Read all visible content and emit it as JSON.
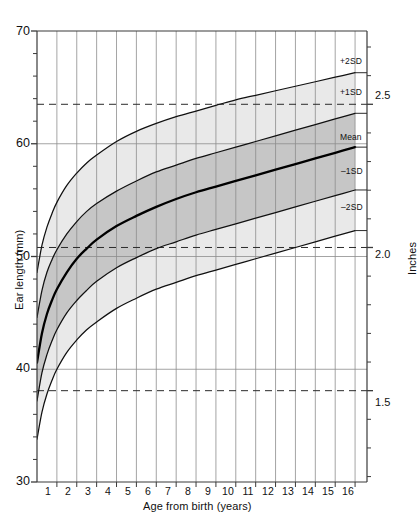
{
  "chart_data": {
    "type": "line",
    "title": "",
    "xlabel": "Age from birth (years)",
    "ylabel": "Ear length (mm)",
    "y2label": "Inches",
    "xlim": [
      0,
      16.6
    ],
    "ylim": [
      30,
      70
    ],
    "grid": true,
    "legend_position": "right-inline",
    "x_ticks": [
      "1",
      "2",
      "3",
      "4",
      "5",
      "6",
      "7",
      "8",
      "9",
      "10",
      "11",
      "12",
      "13",
      "14",
      "15",
      "16"
    ],
    "x_tick_values": [
      1,
      2,
      3,
      4,
      5,
      6,
      7,
      8,
      9,
      10,
      11,
      12,
      13,
      14,
      15,
      16
    ],
    "y_ticks": [
      "70",
      "60",
      "50",
      "40",
      "30"
    ],
    "y_tick_values": [
      70,
      60,
      50,
      40,
      30
    ],
    "y_minor_step_mm": 2,
    "y2_ticks": [
      "2.5",
      "2.0",
      "1.5"
    ],
    "y2_tick_values_mm": [
      63.5,
      50.8,
      38.1
    ],
    "reference_lines": [
      {
        "label": "2.5",
        "value_mm": 63.5,
        "style": "dashed"
      },
      {
        "label": "2.0",
        "value_mm": 50.8,
        "style": "dashed"
      },
      {
        "label": "1.5",
        "value_mm": 38.1,
        "style": "dashed"
      }
    ],
    "x": [
      0,
      0.25,
      0.5,
      0.75,
      1,
      1.5,
      2,
      2.5,
      3,
      4,
      5,
      6,
      7,
      8,
      9,
      10,
      11,
      12,
      13,
      14,
      15,
      16
    ],
    "series": [
      {
        "name": "+2SD",
        "label": "+2SD",
        "values": [
          48.6,
          51.0,
          52.6,
          53.8,
          54.8,
          56.3,
          57.4,
          58.3,
          59.0,
          60.2,
          61.1,
          61.8,
          62.4,
          62.9,
          63.4,
          63.9,
          64.3,
          64.7,
          65.1,
          65.5,
          65.9,
          66.3
        ]
      },
      {
        "name": "+1SD",
        "label": "+1SD",
        "values": [
          44.6,
          47.0,
          48.6,
          49.7,
          50.6,
          52.0,
          53.1,
          54.0,
          54.7,
          55.8,
          56.7,
          57.5,
          58.1,
          58.7,
          59.2,
          59.7,
          60.2,
          60.7,
          61.2,
          61.7,
          62.2,
          62.7
        ]
      },
      {
        "name": "Mean",
        "label": "Mean",
        "values": [
          40.6,
          43.2,
          44.9,
          46.1,
          47.1,
          48.6,
          49.8,
          50.7,
          51.5,
          52.7,
          53.6,
          54.4,
          55.1,
          55.7,
          56.2,
          56.7,
          57.2,
          57.7,
          58.2,
          58.7,
          59.2,
          59.7
        ]
      },
      {
        "name": "-1SD",
        "label": "–1SD",
        "values": [
          37.2,
          39.7,
          41.3,
          42.5,
          43.5,
          45.0,
          46.1,
          47.0,
          47.8,
          49.0,
          49.9,
          50.7,
          51.3,
          51.9,
          52.4,
          52.9,
          53.4,
          53.9,
          54.4,
          54.9,
          55.4,
          55.9
        ]
      },
      {
        "name": "-2SD",
        "label": "–2SD",
        "values": [
          33.8,
          36.2,
          37.8,
          39.0,
          40.0,
          41.5,
          42.6,
          43.5,
          44.2,
          45.4,
          46.3,
          47.1,
          47.7,
          48.3,
          48.8,
          49.3,
          49.8,
          50.3,
          50.8,
          51.3,
          51.8,
          52.3
        ]
      }
    ],
    "bands": [
      {
        "name": "outer-band",
        "upper": "+2SD",
        "lower": "-2SD",
        "color": "#e9e9e9"
      },
      {
        "name": "inner-band",
        "upper": "+1SD",
        "lower": "-1SD",
        "color": "#c6c6c6"
      }
    ]
  },
  "axes": {
    "x_title": "Age from birth (years)",
    "y_title": "Ear length (mm)",
    "y2_title": "Inches"
  },
  "curve_labels": {
    "plus2sd": "+2SD",
    "plus1sd": "+1SD",
    "mean": "Mean",
    "minus1sd": "–1SD",
    "minus2sd": "–2SD"
  },
  "inch_labels": {
    "two_five": "2.5",
    "two_zero": "2.0",
    "one_five": "1.5"
  },
  "y_labels": {
    "t70": "70",
    "t60": "60",
    "t50": "50",
    "t40": "40",
    "t30": "30"
  },
  "x_labels": {
    "x1": "1",
    "x2": "2",
    "x3": "3",
    "x4": "4",
    "x5": "5",
    "x6": "6",
    "x7": "7",
    "x8": "8",
    "x9": "9",
    "x10": "10",
    "x11": "11",
    "x12": "12",
    "x13": "13",
    "x14": "14",
    "x15": "15",
    "x16": "16"
  },
  "colors": {
    "outer_band": "#e9e9e9",
    "inner_band": "#c6c6c6",
    "grid": "#8d8d8d",
    "axis": "#3a3a3a",
    "curve": "#101010",
    "mean_curve": "#000000",
    "background": "#ffffff"
  }
}
